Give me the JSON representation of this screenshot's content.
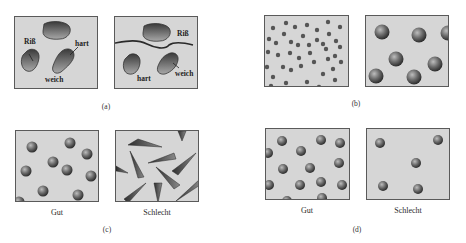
{
  "figure": {
    "panels": [
      {
        "id": "a",
        "label": "(a)",
        "left": {
          "labels": {
            "crack": "Riß",
            "hard": "hart",
            "soft": "weich"
          }
        },
        "right": {
          "labels": {
            "crack": "Riß",
            "hard": "hart",
            "soft": "weich"
          }
        }
      },
      {
        "id": "b",
        "label": "(b)"
      },
      {
        "id": "c",
        "label": "(c)",
        "left_caption": "Gut",
        "right_caption": "Schlecht"
      },
      {
        "id": "d",
        "label": "(d)",
        "left_caption": "Gut",
        "right_caption": "Schlecht"
      }
    ]
  },
  "colors": {
    "panel_bg": "#d6d6d6",
    "panel_border": "#5a5a5a",
    "particle_dark": "#3a3a3a",
    "particle_light": "#9a9a9a"
  }
}
